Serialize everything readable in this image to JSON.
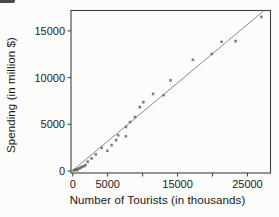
{
  "chart_data": {
    "type": "scatter",
    "title": "",
    "xlabel": "Number of Tourists (in thousands)",
    "ylabel": "Spending (in million $)",
    "xlim": [
      -250,
      28300
    ],
    "ylim": [
      -215,
      17180
    ],
    "grid": false,
    "legend": "none",
    "x_ticks": [
      0,
      5000,
      10000,
      15000,
      20000,
      25000
    ],
    "x_tick_labels": [
      "0",
      "5000",
      "",
      "15000",
      "",
      "25000"
    ],
    "y_ticks": [
      0,
      5000,
      10000,
      15000
    ],
    "y_tick_labels": [
      "0",
      "5000",
      "10000",
      "15000"
    ],
    "points": [
      [
        150,
        60
      ],
      [
        320,
        110
      ],
      [
        480,
        170
      ],
      [
        650,
        90
      ],
      [
        800,
        240
      ],
      [
        950,
        300
      ],
      [
        1150,
        360
      ],
      [
        1350,
        450
      ],
      [
        1600,
        520
      ],
      [
        1850,
        640
      ],
      [
        2150,
        1000
      ],
      [
        2700,
        1350
      ],
      [
        3300,
        1780
      ],
      [
        4150,
        2480
      ],
      [
        4950,
        2160
      ],
      [
        5570,
        2770
      ],
      [
        6200,
        3300
      ],
      [
        6500,
        3830
      ],
      [
        7600,
        3720
      ],
      [
        7620,
        4720
      ],
      [
        8200,
        5250
      ],
      [
        8900,
        5780
      ],
      [
        9600,
        6840
      ],
      [
        10100,
        7370
      ],
      [
        11500,
        8260
      ],
      [
        13000,
        8100
      ],
      [
        14000,
        9700
      ],
      [
        17200,
        11900
      ],
      [
        19900,
        12520
      ],
      [
        21300,
        13830
      ],
      [
        23300,
        13900
      ],
      [
        27000,
        16500
      ]
    ],
    "regression_line": {
      "slope": 0.625,
      "intercept": 60
    },
    "colors": {
      "axis": "#3f3f3f",
      "point": "#5f5f5f",
      "line": "#8c8c8c",
      "background": "#fcfcfa"
    }
  }
}
